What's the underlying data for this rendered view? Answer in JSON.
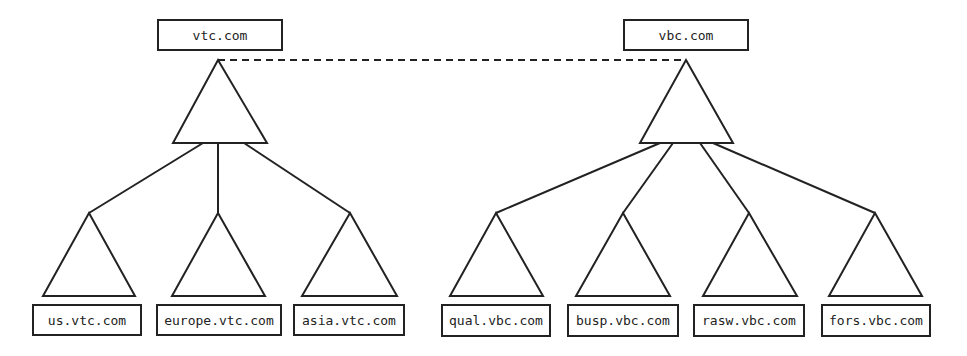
{
  "diagram": {
    "type": "domain-forest",
    "colors": {
      "stroke": "#222222",
      "background": "#ffffff"
    },
    "trust_link": {
      "from": "vtc.com",
      "to": "vbc.com",
      "style": "dashed"
    },
    "trees": [
      {
        "root": {
          "label": "vtc.com",
          "box": [
            158,
            20,
            124,
            30
          ],
          "apex": [
            218,
            60
          ],
          "base": [
            173,
            267,
            143
          ]
        },
        "children": [
          {
            "label": "us.vtc.com",
            "box": [
              33,
              305,
              108,
              30
            ],
            "apex": [
              89,
              213
            ],
            "base": [
              43,
              135,
              296
            ],
            "from": [
              203,
              143
            ]
          },
          {
            "label": "europe.vtc.com",
            "box": [
              157,
              305,
              124,
              30
            ],
            "apex": [
              218,
              213
            ],
            "base": [
              172,
              265,
              296
            ],
            "from": [
              218,
              143
            ]
          },
          {
            "label": "asia.vtc.com",
            "box": [
              294,
              305,
              110,
              30
            ],
            "apex": [
              350,
              213
            ],
            "base": [
              302,
              397,
              296
            ],
            "from": [
              244,
              143
            ]
          }
        ]
      },
      {
        "root": {
          "label": "vbc.com",
          "box": [
            624,
            20,
            124,
            30
          ],
          "apex": [
            686,
            60
          ],
          "base": [
            640,
            733,
            143
          ]
        },
        "children": [
          {
            "label": "qual.vbc.com",
            "box": [
              442,
              305,
              108,
              31
            ],
            "apex": [
              496,
              213
            ],
            "base": [
              450,
              543,
              296
            ],
            "from": [
              660,
              143
            ]
          },
          {
            "label": "busp.vbc.com",
            "box": [
              568,
              305,
              110,
              31
            ],
            "apex": [
              623,
              213
            ],
            "base": [
              576,
              670,
              296
            ],
            "from": [
              673,
              143
            ]
          },
          {
            "label": "rasw.vbc.com",
            "box": [
              694,
              305,
              110,
              31
            ],
            "apex": [
              749,
              213
            ],
            "base": [
              703,
              797,
              296
            ],
            "from": [
              700,
              143
            ]
          },
          {
            "label": "fors.vbc.com",
            "box": [
              822,
              305,
              108,
              31
            ],
            "apex": [
              875,
              213
            ],
            "base": [
              829,
              922,
              296
            ],
            "from": [
              713,
              143
            ]
          }
        ]
      }
    ]
  }
}
